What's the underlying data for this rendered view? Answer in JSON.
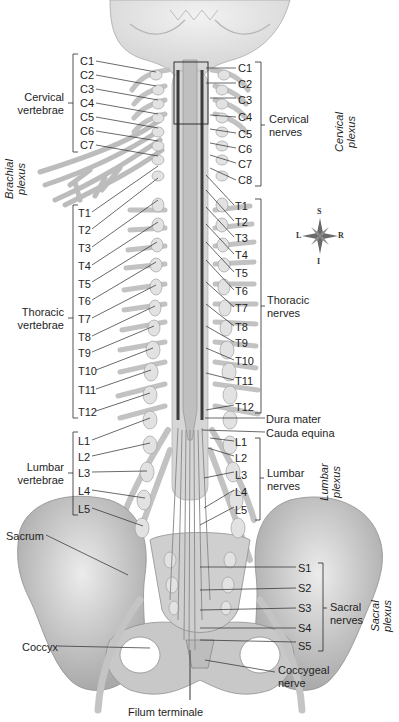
{
  "diagram": {
    "left_labels": {
      "cervical_vertebrae": {
        "group_label": "Cervical\nvertebrae",
        "items": [
          "C1",
          "C2",
          "C3",
          "C4",
          "C5",
          "C6",
          "C7"
        ]
      },
      "thoracic_vertebrae": {
        "group_label": "Thoracic\nvertebrae",
        "items": [
          "T1",
          "T2",
          "T3",
          "T4",
          "T5",
          "T6",
          "T7",
          "T8",
          "T9",
          "T10",
          "T11",
          "T12"
        ]
      },
      "lumbar_vertebrae": {
        "group_label": "Lumbar\nvertebrae",
        "items": [
          "L1",
          "L2",
          "L3",
          "L4",
          "L5"
        ]
      },
      "sacrum": "Sacrum",
      "coccyx": "Coccyx",
      "brachial_plexus": "Brachial\nplexus"
    },
    "right_labels": {
      "cervical_nerves": {
        "group_label": "Cervical\nnerves",
        "items": [
          "C1",
          "C2",
          "C3",
          "C4",
          "C5",
          "C6",
          "C7",
          "C8"
        ]
      },
      "thoracic_nerves": {
        "group_label": "Thoracic\nnerves",
        "items": [
          "T1",
          "T2",
          "T3",
          "T4",
          "T5",
          "T6",
          "T7",
          "T8",
          "T9",
          "T10",
          "T11",
          "T12"
        ]
      },
      "dura_mater": "Dura mater",
      "cauda_equina": "Cauda equina",
      "lumbar_nerves": {
        "group_label": "Lumbar\nnerves",
        "items": [
          "L1",
          "L2",
          "L3",
          "L4",
          "L5"
        ]
      },
      "sacral_nerves": {
        "group_label": "Sacral\nnerves",
        "items": [
          "S1",
          "S2",
          "S3",
          "S4",
          "S5"
        ]
      },
      "coccygeal_nerve": "Coccygeal\nnerve",
      "cervical_plexus": "Cervical\nplexus",
      "lumbar_plexus": "Lumbar\nplexus",
      "sacral_plexus": "Sacral\nplexus"
    },
    "bottom_label": "Filum terminale",
    "compass": {
      "superior": "S",
      "inferior": "I",
      "left": "L",
      "right": "R"
    }
  }
}
